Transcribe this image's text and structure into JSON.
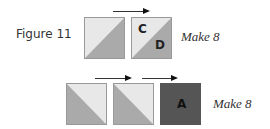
{
  "figure": {
    "label": "Figure 11"
  },
  "rows": [
    {
      "make_label": "Make 8",
      "blocks": [
        {
          "type": "hst-ur",
          "light": "#e8e8e8",
          "dark": "#aaaaaa"
        },
        {
          "type": "hst-ur",
          "light": "#e8e8e8",
          "dark": "#aaaaaa",
          "labels": [
            "C",
            "D"
          ]
        }
      ]
    },
    {
      "make_label": "Make 8",
      "blocks": [
        {
          "type": "hst-ll",
          "light": "#e8e8e8",
          "dark": "#aaaaaa"
        },
        {
          "type": "hst-ll",
          "light": "#e8e8e8",
          "dark": "#aaaaaa"
        },
        {
          "type": "solid",
          "color": "#555555",
          "labels": [
            "A"
          ]
        }
      ]
    }
  ],
  "colors": {
    "light": "#e8e8e8",
    "medium": "#aaaaaa",
    "dark": "#555555"
  }
}
